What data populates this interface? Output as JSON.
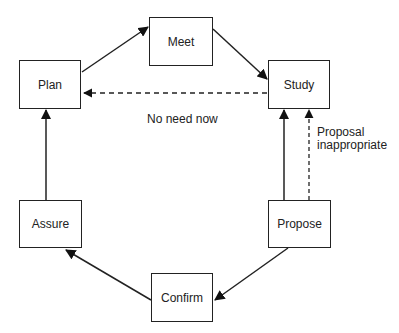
{
  "diagram": {
    "type": "cycle-flow",
    "nodes": [
      {
        "id": "plan",
        "label": "Plan"
      },
      {
        "id": "meet",
        "label": "Meet"
      },
      {
        "id": "study",
        "label": "Study"
      },
      {
        "id": "propose",
        "label": "Propose"
      },
      {
        "id": "confirm",
        "label": "Confirm"
      },
      {
        "id": "assure",
        "label": "Assure"
      }
    ],
    "edges": [
      {
        "from": "plan",
        "to": "meet",
        "style": "solid"
      },
      {
        "from": "meet",
        "to": "study",
        "style": "solid"
      },
      {
        "from": "study",
        "to": "plan",
        "style": "dashed",
        "label": "No need now"
      },
      {
        "from": "propose",
        "to": "study",
        "style": "solid"
      },
      {
        "from": "propose",
        "to": "study",
        "style": "dashed",
        "label": "Proposal inappropriate"
      },
      {
        "from": "propose",
        "to": "confirm",
        "style": "solid"
      },
      {
        "from": "confirm",
        "to": "assure",
        "style": "solid"
      },
      {
        "from": "assure",
        "to": "plan",
        "style": "solid"
      }
    ],
    "labels": {
      "no_need_now": "No need now",
      "proposal_line1": "Proposal",
      "proposal_line2": "inappropriate"
    }
  }
}
